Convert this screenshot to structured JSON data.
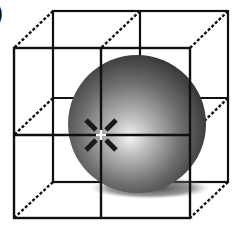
{
  "figure": {
    "panel_label": ")",
    "colors": {
      "background": "#ffffff",
      "lines": "#111111",
      "sphere_highlight": "#f2f2f2",
      "sphere_mid": "#8a8a8a",
      "sphere_dark": "#2e2e2e",
      "shadow": "#3a3a3a",
      "crosshair_center": "#ffffff"
    },
    "cube": {
      "front": {
        "x1": 14,
        "y1": 48,
        "x2": 190,
        "y2": 218,
        "mid_x": 101,
        "mid_y": 135
      },
      "back": {
        "x1": 53,
        "y1": 11,
        "x2": 228,
        "y2": 182,
        "mid_x": 140,
        "mid_y": 98
      }
    },
    "sphere": {
      "cx": 137,
      "cy": 124,
      "r": 69
    },
    "marker": {
      "type": "crosshair",
      "x": 101,
      "y": 135
    }
  }
}
